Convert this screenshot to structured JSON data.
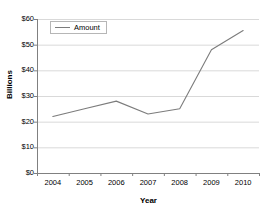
{
  "chart_data": {
    "type": "line",
    "title": "",
    "xlabel": "Year",
    "ylabel": "Billions",
    "categories": [
      "2004",
      "2005",
      "2006",
      "2007",
      "2008",
      "2009",
      "2010"
    ],
    "x": [
      2004,
      2005,
      2006,
      2007,
      2008,
      2009,
      2010
    ],
    "series": [
      {
        "name": "Amount",
        "color": "#7c7c7c",
        "values": [
          22,
          25,
          28,
          23,
          25,
          48,
          55.5
        ]
      }
    ],
    "ylim": [
      0,
      60
    ],
    "ytick_values": [
      0,
      10,
      20,
      30,
      40,
      50,
      60
    ],
    "ytick_labels": [
      "$0",
      "$10",
      "$20",
      "$30",
      "$40",
      "$50",
      "$60"
    ],
    "xtick_labels": [
      "2004",
      "2005",
      "2006",
      "2007",
      "2008",
      "2009",
      "2010"
    ],
    "grid": true,
    "grid_axis": "y",
    "grid_color": "#d9d9d9",
    "axis_color": "#808080",
    "legend": {
      "position": "top-left-inside",
      "entries": [
        "Amount"
      ]
    }
  },
  "legend": {
    "label": "Amount"
  },
  "axes": {
    "x_title": "Year",
    "y_title": "Billions"
  }
}
